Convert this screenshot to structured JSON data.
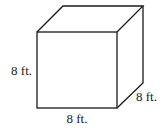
{
  "diagram": {
    "type": "cube",
    "stroke_color": "#1a1a1a",
    "vertices": {
      "front_top_left": [
        37,
        32
      ],
      "front_top_right": [
        117,
        32
      ],
      "front_bottom_left": [
        37,
        108
      ],
      "front_bottom_right": [
        117,
        108
      ],
      "back_top_left": [
        63,
        6
      ],
      "back_top_right": [
        143,
        6
      ],
      "back_bottom_right": [
        143,
        83
      ]
    },
    "labels": {
      "height": "8 ft.",
      "width": "8 ft.",
      "depth": "8 ft."
    }
  }
}
